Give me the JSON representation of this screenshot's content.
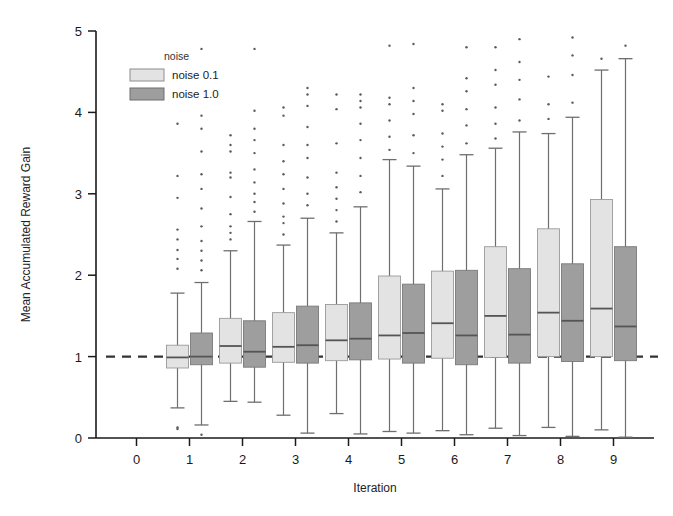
{
  "chart_data": {
    "type": "box",
    "title": "",
    "xlabel": "Iteration",
    "ylabel": "Mean Accumulated Reward Gain",
    "xlim": [
      -0.5,
      9.5
    ],
    "ylim": [
      0,
      5
    ],
    "xticks": [
      "0",
      "1",
      "2",
      "3",
      "4",
      "5",
      "6",
      "7",
      "8",
      "9"
    ],
    "yticks": [
      "0",
      "1",
      "2",
      "3",
      "4",
      "5"
    ],
    "grid": false,
    "reference_line": {
      "y": 1,
      "style": "dashed",
      "color": "#333333"
    },
    "legend": {
      "title": "noise",
      "position": "upper-left-inside",
      "entries": [
        {
          "label": "noise 0.1",
          "color": "#e3e3e3",
          "edge": "#8c8c8c"
        },
        {
          "label": "noise 1.0",
          "color": "#9e9e9e",
          "edge": "#6f6f6f"
        }
      ]
    },
    "categories": [
      0,
      1,
      2,
      3,
      4,
      5,
      6,
      7,
      8,
      9
    ],
    "series": [
      {
        "name": "noise 0.1",
        "color": "#e3e3e3",
        "boxes": [
          null,
          {
            "whisker_low": 0.37,
            "q1": 0.86,
            "median": 0.99,
            "q3": 1.14,
            "whisker_high": 1.78,
            "outliers": [
              0.11,
              0.13,
              2.08,
              2.2,
              2.31,
              2.44,
              2.56,
              2.95,
              3.22,
              3.86
            ]
          },
          {
            "whisker_low": 0.45,
            "q1": 0.92,
            "median": 1.13,
            "q3": 1.47,
            "whisker_high": 2.3,
            "outliers": [
              2.44,
              2.52,
              2.6,
              2.75,
              2.96,
              3.2,
              3.26,
              3.52,
              3.6,
              3.72
            ]
          },
          {
            "whisker_low": 0.28,
            "q1": 0.93,
            "median": 1.12,
            "q3": 1.54,
            "whisker_high": 2.37,
            "outliers": [
              2.5,
              2.64,
              2.72,
              2.88,
              3.06,
              3.24,
              3.4,
              3.6,
              3.96,
              4.06
            ]
          },
          {
            "whisker_low": 0.3,
            "q1": 0.95,
            "median": 1.2,
            "q3": 1.64,
            "whisker_high": 2.52,
            "outliers": [
              2.66,
              2.8,
              2.94,
              3.08,
              3.26,
              3.62,
              4.04,
              4.22
            ]
          },
          {
            "whisker_low": 0.08,
            "q1": 0.97,
            "median": 1.26,
            "q3": 1.99,
            "whisker_high": 3.42,
            "outliers": [
              3.54,
              3.7,
              3.9,
              4.1,
              4.18,
              4.82
            ]
          },
          {
            "whisker_low": 0.09,
            "q1": 0.98,
            "median": 1.41,
            "q3": 2.05,
            "whisker_high": 3.06,
            "outliers": [
              3.22,
              3.42,
              3.58,
              3.74,
              4.02,
              4.1
            ]
          },
          {
            "whisker_low": 0.12,
            "q1": 0.99,
            "median": 1.5,
            "q3": 2.35,
            "whisker_high": 3.56,
            "outliers": [
              3.68,
              3.86,
              4.06,
              4.34,
              4.52,
              4.8
            ]
          },
          {
            "whisker_low": 0.13,
            "q1": 1.0,
            "median": 1.54,
            "q3": 2.57,
            "whisker_high": 3.74,
            "outliers": [
              3.92,
              4.1,
              4.44
            ]
          },
          {
            "whisker_low": 0.1,
            "q1": 1.0,
            "median": 1.59,
            "q3": 2.93,
            "whisker_high": 4.52,
            "outliers": [
              4.66
            ]
          }
        ]
      },
      {
        "name": "noise 1.0",
        "color": "#9e9e9e",
        "boxes": [
          null,
          {
            "whisker_low": 0.16,
            "q1": 0.9,
            "median": 1.0,
            "q3": 1.29,
            "whisker_high": 1.91,
            "outliers": [
              0.04,
              2.06,
              2.18,
              2.3,
              2.42,
              2.6,
              2.82,
              3.06,
              3.24,
              3.52,
              3.8,
              3.96,
              4.78
            ]
          },
          {
            "whisker_low": 0.44,
            "q1": 0.87,
            "median": 1.06,
            "q3": 1.44,
            "whisker_high": 2.66,
            "outliers": [
              2.78,
              2.9,
              3.0,
              3.14,
              3.3,
              3.5,
              3.66,
              3.8,
              4.02,
              4.78
            ]
          },
          {
            "whisker_low": 0.06,
            "q1": 0.92,
            "median": 1.14,
            "q3": 1.62,
            "whisker_high": 2.7,
            "outliers": [
              2.86,
              3.0,
              3.2,
              3.44,
              3.6,
              3.82,
              4.08,
              4.22,
              4.3
            ]
          },
          {
            "whisker_low": 0.05,
            "q1": 0.96,
            "median": 1.22,
            "q3": 1.66,
            "whisker_high": 2.84,
            "outliers": [
              3.02,
              3.22,
              3.44,
              3.66,
              3.86,
              4.06,
              4.14,
              4.22
            ]
          },
          {
            "whisker_low": 0.06,
            "q1": 0.92,
            "median": 1.29,
            "q3": 1.89,
            "whisker_high": 3.34,
            "outliers": [
              3.5,
              3.72,
              3.98,
              4.14,
              4.3,
              4.84
            ]
          },
          {
            "whisker_low": 0.04,
            "q1": 0.9,
            "median": 1.26,
            "q3": 2.06,
            "whisker_high": 3.48,
            "outliers": [
              3.62,
              3.84,
              4.04,
              4.26,
              4.42,
              4.8
            ]
          },
          {
            "whisker_low": 0.03,
            "q1": 0.92,
            "median": 1.27,
            "q3": 2.08,
            "whisker_high": 3.76,
            "outliers": [
              3.9,
              4.16,
              4.4,
              4.62,
              4.9
            ]
          },
          {
            "whisker_low": 0.02,
            "q1": 0.94,
            "median": 1.44,
            "q3": 2.14,
            "whisker_high": 3.94,
            "outliers": [
              4.12,
              4.46,
              4.7,
              4.92
            ]
          },
          {
            "whisker_low": 0.01,
            "q1": 0.95,
            "median": 1.37,
            "q3": 2.35,
            "whisker_high": 4.66,
            "outliers": [
              4.82
            ]
          }
        ]
      }
    ]
  }
}
